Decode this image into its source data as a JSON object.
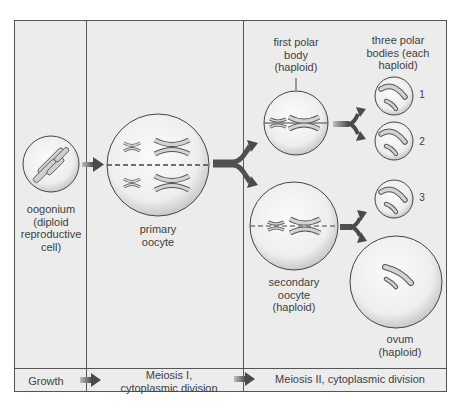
{
  "diagram": {
    "colors": {
      "background": "#ececec",
      "border": "#555555",
      "cell_fill": "#f2f2f2",
      "chromosome": "#cfcfcf",
      "arrow": "#555555"
    },
    "cells": {
      "oogonium": {
        "label_lines": [
          "oogonium",
          "(diploid",
          "reproductive",
          "cell)"
        ]
      },
      "primary_oocyte": {
        "label_lines": [
          "primary",
          "oocyte"
        ]
      },
      "first_polar_body": {
        "label_lines": [
          "first polar",
          "body",
          "(haploid)"
        ]
      },
      "three_polar_bodies": {
        "label_lines": [
          "three polar",
          "bodies (each",
          "haploid)"
        ],
        "numbers": [
          "1",
          "2",
          "3"
        ]
      },
      "secondary_oocyte": {
        "label_lines": [
          "secondary",
          "oocyte",
          "(haploid)"
        ]
      },
      "ovum": {
        "label_lines": [
          "ovum",
          "(haploid)"
        ]
      }
    },
    "stages": [
      {
        "label_lines": [
          "Growth"
        ]
      },
      {
        "label_lines": [
          "Meiosis I,",
          "cytoplasmic division"
        ]
      },
      {
        "label_lines": [
          "Meiosis II, cytoplasmic division"
        ]
      }
    ]
  }
}
